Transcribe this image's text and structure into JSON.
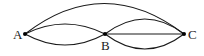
{
  "diagram": {
    "type": "multigraph",
    "nodes": [
      {
        "id": "A",
        "label": "A",
        "x": 25,
        "y": 34
      },
      {
        "id": "B",
        "label": "B",
        "x": 105,
        "y": 34
      },
      {
        "id": "C",
        "label": "C",
        "x": 184,
        "y": 34
      }
    ],
    "edges": [
      {
        "from": "A",
        "to": "C",
        "shape": "arc-upper"
      },
      {
        "from": "A",
        "to": "B",
        "shape": "arc-upper"
      },
      {
        "from": "A",
        "to": "B",
        "shape": "arc-lower"
      },
      {
        "from": "B",
        "to": "C",
        "shape": "arc-upper"
      },
      {
        "from": "B",
        "to": "C",
        "shape": "straight"
      },
      {
        "from": "B",
        "to": "C",
        "shape": "arc-lower"
      }
    ],
    "colors": {
      "stroke": "#1a1a1a",
      "node": "#000000",
      "text": "#222222",
      "background": "#ffffff"
    }
  }
}
